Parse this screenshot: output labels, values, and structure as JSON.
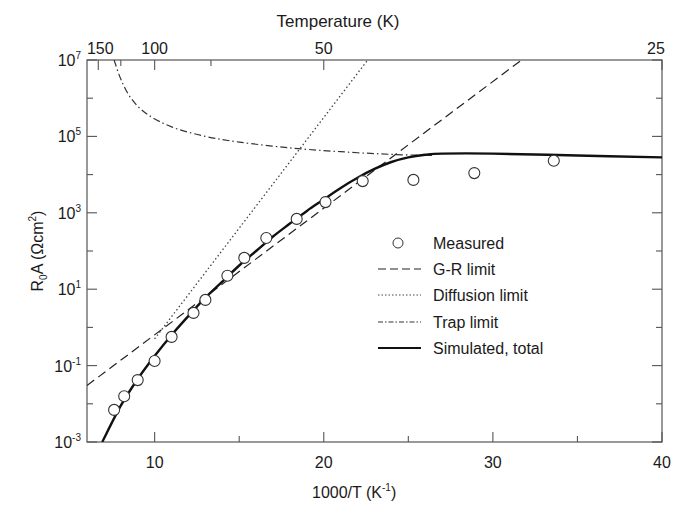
{
  "chart_data": {
    "type": "line",
    "title": "",
    "top_axis_label": "Temperature (K)",
    "xlabel": "1000/T (K⁻¹)",
    "ylabel": "R₀A (Ωcm²)",
    "xlim": [
      6,
      40
    ],
    "ylim": [
      0.001,
      10000000
    ],
    "yscale": "log",
    "grid": false,
    "legend_position": "center-right",
    "x_ticks": [
      {
        "value": 10,
        "label": "10"
      },
      {
        "value": 20,
        "label": "20"
      },
      {
        "value": 30,
        "label": "30"
      },
      {
        "value": 40,
        "label": "40"
      }
    ],
    "x_minor_ticks": [
      15,
      25,
      35
    ],
    "top_ticks": [
      {
        "value": 6.667,
        "label": "150"
      },
      {
        "value": 10,
        "label": "100"
      },
      {
        "value": 20,
        "label": "50"
      },
      {
        "value": 40,
        "label": "25"
      }
    ],
    "top_minor_ticks": [
      8,
      13.33
    ],
    "y_ticks": [
      {
        "exp": "7",
        "label": "10^7"
      },
      {
        "exp": "5",
        "label": "10^5"
      },
      {
        "exp": "3",
        "label": "10^3"
      },
      {
        "exp": "1",
        "label": "10^1"
      },
      {
        "exp": "-1",
        "label": "10^-1"
      },
      {
        "exp": "-3",
        "label": "10^-3"
      }
    ],
    "y_minor_ticks_exp": [
      6,
      4,
      2,
      0,
      -2
    ],
    "series": [
      {
        "name": "Measured",
        "style": "open-circle",
        "x": [
          7.6,
          8.2,
          9.0,
          10.0,
          11.0,
          12.3,
          13.0,
          14.3,
          15.3,
          16.6,
          18.4,
          20.1,
          22.3,
          25.3,
          28.9,
          33.6
        ],
        "log10_y": [
          -2.16,
          -1.8,
          -1.38,
          -0.88,
          -0.25,
          0.38,
          0.72,
          1.35,
          1.82,
          2.34,
          2.84,
          3.28,
          3.83,
          3.86,
          4.04,
          4.36
        ]
      },
      {
        "name": "G-R limit",
        "style": "dashed",
        "x": [
          6.0,
          31.7
        ],
        "log10_y": [
          -1.52,
          7.0
        ]
      },
      {
        "name": "Diffusion limit",
        "style": "dotted",
        "x": [
          10.0,
          22.6
        ],
        "log10_y": [
          -0.3,
          7.0
        ]
      },
      {
        "name": "Trap limit",
        "style": "dash-dot",
        "x": [
          7.6,
          8.0,
          8.6,
          9.5,
          11.0,
          13.0,
          15.0,
          18.0,
          21.0,
          24.0,
          26.5
        ],
        "log10_y": [
          7.0,
          6.5,
          6.0,
          5.6,
          5.25,
          5.0,
          4.85,
          4.7,
          4.6,
          4.53,
          4.5
        ]
      },
      {
        "name": "Simulated, total",
        "style": "solid",
        "x": [
          6.9,
          8.0,
          9.0,
          10.0,
          11.0,
          12.0,
          13.0,
          14.0,
          15.0,
          16.0,
          17.0,
          18.0,
          19.0,
          20.0,
          21.0,
          22.0,
          23.0,
          24.0,
          25.0,
          26.0,
          27.0,
          30.0,
          35.0,
          40.0
        ],
        "log10_y": [
          -3.0,
          -2.05,
          -1.35,
          -0.75,
          -0.2,
          0.3,
          0.78,
          1.2,
          1.62,
          2.0,
          2.38,
          2.72,
          3.05,
          3.35,
          3.65,
          3.92,
          4.15,
          4.33,
          4.45,
          4.52,
          4.55,
          4.55,
          4.5,
          4.45
        ]
      }
    ]
  },
  "legend": {
    "items": [
      {
        "label": "Measured",
        "style": "open-circle"
      },
      {
        "label": "G-R limit",
        "style": "dashed"
      },
      {
        "label": "Diffusion limit",
        "style": "dotted"
      },
      {
        "label": "Trap limit",
        "style": "dash-dot"
      },
      {
        "label": "Simulated, total",
        "style": "solid"
      }
    ]
  },
  "labels": {
    "top_axis": "Temperature (K)",
    "x_axis_main": "1000/T (K",
    "x_axis_sup": "-1",
    "x_axis_close": ")",
    "y_axis_main": "R",
    "y_axis_sub": "0",
    "y_axis_mid": "A (Ωcm",
    "y_axis_sup": "2",
    "y_axis_close": ")",
    "y_tick_base": "10"
  },
  "colors": {
    "ink": "#1a1a1a",
    "axis": "#555555",
    "background": "#ffffff"
  }
}
